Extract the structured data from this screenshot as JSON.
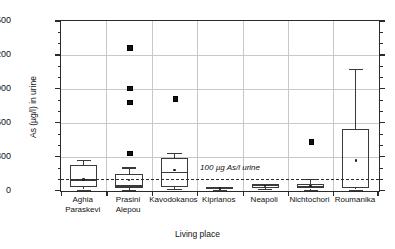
{
  "chart_data": {
    "type": "box",
    "title": "",
    "subtitle": "",
    "xlabel": "Living place",
    "ylabel": "As (µg/l) in urine",
    "ylim": [
      0,
      1500
    ],
    "yticks": [
      0,
      300,
      600,
      900,
      1200,
      1500
    ],
    "ytick_labels": [
      "0",
      "300",
      "600",
      "900",
      "1200",
      "1500"
    ],
    "minor_tick_interval": 100,
    "grid": "horizontal-and-vertical",
    "legend": "none",
    "reference_line": {
      "value": 100,
      "label": "100 µg As/l urine",
      "style": "dashed"
    },
    "categories": [
      "Aghia Paraskevi",
      "Prasini Alepou",
      "Kavodokanos",
      "Kiprianos",
      "Neapoli",
      "Nichtochori",
      "Roumanika"
    ],
    "category_lines": [
      [
        "Aghia",
        "Paraskevi"
      ],
      [
        "Prasini",
        "Alepou"
      ],
      [
        "Kavodokanos",
        ""
      ],
      [
        "Kiprianos",
        ""
      ],
      [
        "Neapoli",
        ""
      ],
      [
        "Nichtochori",
        ""
      ],
      [
        "Roumanika",
        ""
      ]
    ],
    "boxes": [
      {
        "category": "Aghia Paraskevi",
        "whisker_low": 10,
        "q1": 35,
        "median": 95,
        "q3": 230,
        "whisker_high": 275,
        "mean": 100,
        "outliers": []
      },
      {
        "category": "Prasini Alepou",
        "whisker_low": 5,
        "q1": 20,
        "median": 40,
        "q3": 145,
        "whisker_high": 205,
        "mean": 95,
        "outliers": [
          1270,
          910,
          790,
          335
        ]
      },
      {
        "category": "Kavodokanos",
        "whisker_low": 15,
        "q1": 30,
        "median": 160,
        "q3": 290,
        "whisker_high": 330,
        "mean": 180,
        "outliers": [
          820
        ]
      },
      {
        "category": "Kiprianos",
        "whisker_low": 10,
        "q1": 12,
        "median": 20,
        "q3": 28,
        "whisker_high": 32,
        "mean": 20,
        "outliers": []
      },
      {
        "category": "Neapoli",
        "whisker_low": 15,
        "q1": 22,
        "median": 45,
        "q3": 55,
        "whisker_high": 62,
        "mean": 42,
        "outliers": []
      },
      {
        "category": "Nichtochori",
        "whisker_low": 10,
        "q1": 18,
        "median": 35,
        "q3": 60,
        "whisker_high": 100,
        "mean": 40,
        "outliers": [
          440
        ]
      },
      {
        "category": "Roumanika",
        "whisker_low": 10,
        "q1": 20,
        "median": 25,
        "q3": 545,
        "whisker_high": 1075,
        "mean": 265,
        "outliers": []
      }
    ],
    "colors": {
      "axis": "#2b2b2b",
      "grid": "#c8c8c8",
      "box": "#3a3a3a",
      "marker": "#111111",
      "background": "#ffffff"
    }
  }
}
